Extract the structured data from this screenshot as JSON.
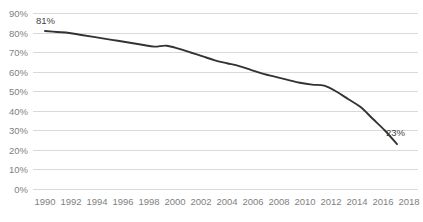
{
  "chart_data": {
    "type": "line",
    "title": "",
    "subtitle": "",
    "xlabel": "",
    "ylabel": "",
    "grid": true,
    "legend": false,
    "legend_position": "none",
    "line_color": "#333333",
    "gridline_color": "#d9d9d9",
    "tick_label_color": "#7f7f7f",
    "data_label_color": "#3f3f3f",
    "background_color": "#ffffff",
    "xlim": [
      1990,
      2019
    ],
    "ylim": [
      0,
      90
    ],
    "y_ticks": [
      "0%",
      "10%",
      "20%",
      "30%",
      "40%",
      "50%",
      "60%",
      "70%",
      "80%",
      "90%"
    ],
    "y_tick_values": [
      0,
      10,
      20,
      30,
      40,
      50,
      60,
      70,
      80,
      90
    ],
    "x_ticks": [
      "1990",
      "1992",
      "1994",
      "1996",
      "1998",
      "2000",
      "2002",
      "2004",
      "2006",
      "2008",
      "2010",
      "2012",
      "2014",
      "2016",
      "2018"
    ],
    "x_tick_values": [
      1990,
      1992,
      1994,
      1996,
      1998,
      2000,
      2002,
      2004,
      2006,
      2008,
      2010,
      2012,
      2014,
      2016,
      2018
    ],
    "x": [
      1990,
      1991,
      1992,
      1993,
      1994,
      1995,
      1996,
      1997,
      1998,
      1999,
      2000,
      2001,
      2002,
      2003,
      2004,
      2005,
      2006,
      2007,
      2008,
      2009,
      2010,
      2011,
      2012,
      2013,
      2014,
      2015,
      2016,
      2017,
      2018,
      2019
    ],
    "values": [
      81,
      80.5,
      80,
      79,
      78,
      77,
      76,
      75,
      74,
      73,
      73.5,
      72,
      70,
      68,
      66,
      64.5,
      63,
      61,
      59,
      57.5,
      56,
      54.5,
      53.5,
      53,
      50,
      46,
      42,
      36,
      30,
      23
    ],
    "annotations": [
      {
        "label": "81%",
        "x": 1990,
        "y": 81
      },
      {
        "label": "23%",
        "x": 2019,
        "y": 23
      }
    ]
  }
}
